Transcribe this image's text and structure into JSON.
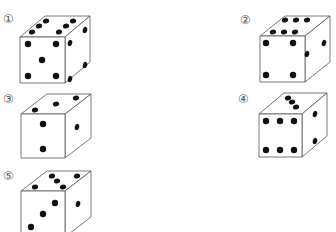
{
  "options": [
    {
      "label": "1",
      "label_pos": [
        3,
        14
      ],
      "die": {
        "front": [
          20,
          37,
          45,
          46
        ],
        "depth": [
          25,
          -21
        ],
        "top_pips": [
          [
            32,
            32
          ],
          [
            39,
            26
          ],
          [
            46,
            21
          ],
          [
            59,
            32
          ],
          [
            66,
            26
          ],
          [
            73,
            21
          ]
        ],
        "front_pips": [
          [
            28,
            44
          ],
          [
            56,
            44
          ],
          [
            42,
            60
          ],
          [
            28,
            76
          ],
          [
            56,
            76
          ]
        ],
        "right_pips": [
          [
            85,
            30
          ],
          [
            85,
            65
          ],
          [
            70,
            43
          ],
          [
            70,
            79
          ]
        ]
      }
    },
    {
      "label": "2",
      "label_pos": [
        240,
        15
      ],
      "die": {
        "front": [
          260,
          36,
          45,
          46
        ],
        "depth": [
          25,
          -20
        ],
        "top_pips": [
          [
            273,
            32
          ],
          [
            284,
            32
          ],
          [
            295,
            32
          ],
          [
            285,
            20
          ],
          [
            296,
            20
          ],
          [
            307,
            20
          ]
        ],
        "front_pips": [
          [
            266,
            43
          ],
          [
            293,
            43
          ],
          [
            266,
            75
          ],
          [
            293,
            75
          ]
        ],
        "right_pips": [
          [
            324,
            43
          ],
          [
            307,
            54
          ]
        ]
      }
    },
    {
      "label": "3",
      "label_pos": [
        3,
        94
      ],
      "die": {
        "front": [
          21,
          114,
          44,
          44
        ],
        "depth": [
          26,
          -20
        ],
        "top_pips": [
          [
            35,
            110
          ],
          [
            56,
            104
          ],
          [
            76,
            98
          ]
        ],
        "front_pips": [
          [
            43,
            124
          ],
          [
            43,
            149
          ]
        ],
        "right_pips": [
          [
            77,
            127
          ]
        ]
      }
    },
    {
      "label": "4",
      "label_pos": [
        238,
        94
      ],
      "die": {
        "front": [
          259,
          114,
          43,
          43
        ],
        "depth": [
          25,
          -21
        ],
        "top_pips": [
          [
            288,
            98
          ],
          [
            292,
            102
          ],
          [
            296,
            107
          ]
        ],
        "front_pips": [
          [
            266,
            121
          ],
          [
            280,
            121
          ],
          [
            294,
            121
          ],
          [
            266,
            150
          ],
          [
            280,
            150
          ],
          [
            294,
            150
          ]
        ],
        "right_pips": [
          [
            315,
            114
          ],
          [
            315,
            141
          ]
        ]
      }
    },
    {
      "label": "5",
      "label_pos": [
        3,
        171
      ],
      "die": {
        "front": [
          21,
          191,
          44,
          46
        ],
        "depth": [
          26,
          -20
        ],
        "top_pips": [
          [
            52,
            176
          ],
          [
            57,
            181
          ],
          [
            63,
            187
          ],
          [
            77,
            176
          ],
          [
            35,
            187
          ]
        ],
        "front_pips": [
          [
            55,
            203
          ],
          [
            43,
            214
          ],
          [
            31,
            227
          ]
        ],
        "right_pips": [
          [
            78,
            204
          ]
        ]
      }
    }
  ],
  "colors": {
    "line": "#555555",
    "pip": "#111111",
    "label": "#555555"
  },
  "label_glyphs": [
    "①",
    "②",
    "③",
    "④",
    "⑤"
  ]
}
